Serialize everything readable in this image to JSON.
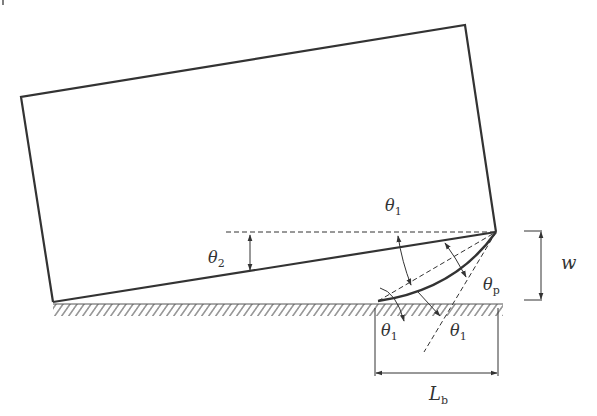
{
  "diagram": {
    "type": "engineering-schematic",
    "colors": {
      "stroke": "#333333",
      "background": "#ffffff"
    },
    "labels": {
      "theta1_top": {
        "main": "θ",
        "sub": "1"
      },
      "theta2": {
        "main": "θ",
        "sub": "2"
      },
      "theta_p": {
        "main": "θ",
        "sub": "p"
      },
      "theta1_bottom_left": {
        "main": "θ",
        "sub": "1"
      },
      "theta1_bottom_right": {
        "main": "θ",
        "sub": "1"
      },
      "w": {
        "main": "w"
      },
      "L_b": {
        "main": "L",
        "sub": "b"
      }
    },
    "dimensions": [
      {
        "name": "w",
        "meaning": "vertical height of contact region"
      },
      {
        "name": "L_b",
        "meaning": "horizontal length of contact base"
      }
    ],
    "angles": [
      "θ1",
      "θ2",
      "θp"
    ]
  }
}
